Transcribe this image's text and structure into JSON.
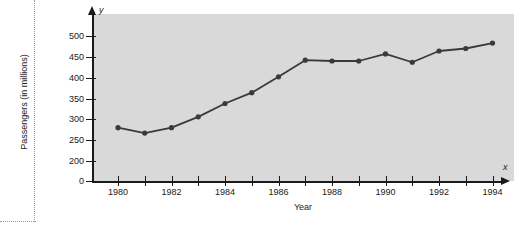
{
  "figure": {
    "background_color": "#ffffff",
    "plot_background_color": "#d9d9d9",
    "axis_color": "#1a1a1a",
    "series_color": "#3a3a3a",
    "guide_color": "#9b9b9b",
    "y_axis_variable": "y",
    "x_axis_variable": "x"
  },
  "chart_data": {
    "type": "line",
    "title": "",
    "subtitle": "",
    "xlabel": "Year",
    "ylabel": "Passengers (in millions)",
    "x": [
      1980,
      1981,
      1982,
      1983,
      1984,
      1985,
      1986,
      1987,
      1988,
      1989,
      1990,
      1991,
      1992,
      1993,
      1994
    ],
    "values": [
      280,
      267,
      280,
      306,
      338,
      364,
      402,
      442,
      440,
      440,
      457,
      437,
      464,
      470,
      483
    ],
    "series": [
      {
        "name": "Passengers",
        "values": [
          280,
          267,
          280,
          306,
          338,
          364,
          402,
          442,
          440,
          440,
          457,
          437,
          464,
          470,
          483
        ]
      }
    ],
    "xlim": [
      1979.2,
      1994.8
    ],
    "ylim": [
      180,
      510
    ],
    "yticks": [
      0,
      200,
      250,
      300,
      350,
      400,
      450,
      500
    ],
    "ytick_labels": [
      "0",
      "200",
      "250",
      "300",
      "350",
      "400",
      "450",
      "500"
    ],
    "y_axis_broken": true,
    "xticks": [
      1980,
      1981,
      1982,
      1983,
      1984,
      1985,
      1986,
      1987,
      1988,
      1989,
      1990,
      1991,
      1992,
      1993,
      1994
    ],
    "xtick_labels": [
      "1980",
      "",
      "1982",
      "",
      "1984",
      "",
      "1986",
      "",
      "1988",
      "",
      "1990",
      "",
      "1992",
      "",
      "1994"
    ],
    "grid": false,
    "legend": false,
    "legend_position": "none",
    "marker": "filled-circle",
    "annotations": []
  }
}
